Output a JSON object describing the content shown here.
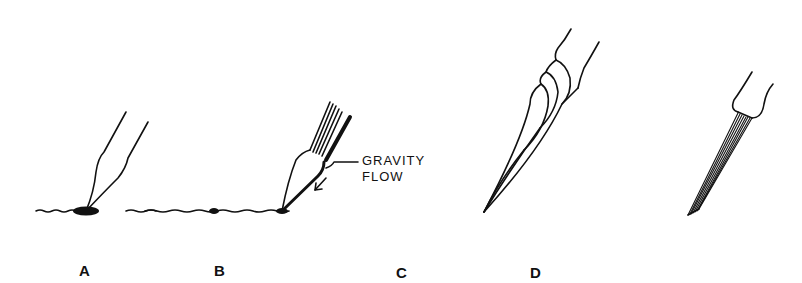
{
  "figure": {
    "panels": [
      {
        "id": "A",
        "label": "A",
        "description": "pen tip touching surface with ink blob"
      },
      {
        "id": "B",
        "label": "B",
        "description": "bristle pen depositing ink via gravity flow"
      },
      {
        "id": "C",
        "label": "C",
        "description": "twisted/curved brush tip"
      },
      {
        "id": "D",
        "label": "D",
        "description": "straight fine-line bristle tip"
      }
    ],
    "callout": {
      "line1": "GRAVITY",
      "line2": "FLOW"
    },
    "colors": {
      "ink": "#111111",
      "background": "#ffffff"
    }
  }
}
